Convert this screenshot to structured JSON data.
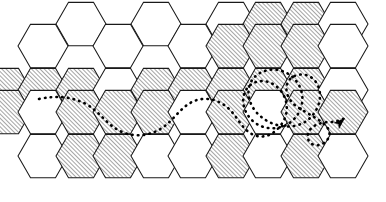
{
  "figure": {
    "title": "Hexagonal cell grid with dotted trajectory",
    "caption": "",
    "width": 386,
    "height": 202,
    "background_color": "#ffffff"
  },
  "style": {
    "outline_color": "#1a1a1a",
    "outline_width": 1.05,
    "hatch_color": "#2b2b2b",
    "hatch_angle_deg": 45,
    "hatch_spacing": 3,
    "fill_white": "#ffffff",
    "path_color": "#000000",
    "path_dot_size": 2.6,
    "path_dot_gap": 5.2
  },
  "grid": {
    "orientation": "flat-top",
    "hex_radius": 25,
    "column_step": 37.5,
    "row_step": 43.3,
    "rows": 4,
    "legend": {
      "hatched_label": "hatched cell",
      "white_label": "empty cell"
    },
    "cells": [
      {
        "id": "r0c2",
        "cx": 81,
        "cy": 24,
        "fill": "hatched_or_white"
      },
      {
        "id": "r0c4",
        "cx": 156,
        "cy": 24,
        "fill": "white"
      },
      {
        "id": "r0c6",
        "cx": 231,
        "cy": 24,
        "fill": "white"
      },
      {
        "id": "r0c7",
        "cx": 268,
        "cy": 24,
        "fill": "hatched"
      },
      {
        "id": "r0c8",
        "cx": 306,
        "cy": 24,
        "fill": "hatched"
      },
      {
        "id": "r0c9",
        "cx": 343,
        "cy": 24,
        "fill": "white"
      },
      {
        "id": "r1c1",
        "cx": 43,
        "cy": 46,
        "fill": "white"
      },
      {
        "id": "r1c3",
        "cx": 118,
        "cy": 46,
        "fill": "white"
      },
      {
        "id": "r1c5",
        "cx": 193,
        "cy": 46,
        "fill": "white"
      },
      {
        "id": "r1c6",
        "cx": 231,
        "cy": 46,
        "fill": "hatched"
      },
      {
        "id": "r1c7",
        "cx": 268,
        "cy": 46,
        "fill": "hatched"
      },
      {
        "id": "r1c8",
        "cx": 306,
        "cy": 46,
        "fill": "hatched"
      },
      {
        "id": "r1c9",
        "cx": 343,
        "cy": 46,
        "fill": "white"
      },
      {
        "id": "r2c0",
        "cx": 6,
        "cy": 90,
        "fill": "hatched"
      },
      {
        "id": "r2c1",
        "cx": 43,
        "cy": 90,
        "fill": "hatched"
      },
      {
        "id": "r2c2",
        "cx": 81,
        "cy": 90,
        "fill": "hatched"
      },
      {
        "id": "r2c3",
        "cx": 118,
        "cy": 90,
        "fill": "white"
      },
      {
        "id": "r2c4",
        "cx": 156,
        "cy": 90,
        "fill": "hatched"
      },
      {
        "id": "r2c5",
        "cx": 193,
        "cy": 90,
        "fill": "hatched"
      },
      {
        "id": "r2c6",
        "cx": 231,
        "cy": 90,
        "fill": "hatched"
      },
      {
        "id": "r2c7",
        "cx": 268,
        "cy": 90,
        "fill": "hatched"
      },
      {
        "id": "r2c8",
        "cx": 306,
        "cy": 90,
        "fill": "hatched"
      },
      {
        "id": "r2c9",
        "cx": 343,
        "cy": 90,
        "fill": "white"
      },
      {
        "id": "r3c0",
        "cx": 6,
        "cy": 112,
        "fill": "hatched"
      },
      {
        "id": "r3c1",
        "cx": 43,
        "cy": 112,
        "fill": "white"
      },
      {
        "id": "r3c2",
        "cx": 81,
        "cy": 112,
        "fill": "hatched"
      },
      {
        "id": "r3c3",
        "cx": 118,
        "cy": 112,
        "fill": "hatched"
      },
      {
        "id": "r3c4",
        "cx": 156,
        "cy": 112,
        "fill": "hatched"
      },
      {
        "id": "r3c5",
        "cx": 193,
        "cy": 112,
        "fill": "white"
      },
      {
        "id": "r3c6",
        "cx": 231,
        "cy": 112,
        "fill": "hatched"
      },
      {
        "id": "r3c7",
        "cx": 268,
        "cy": 112,
        "fill": "white"
      },
      {
        "id": "r3c8",
        "cx": 306,
        "cy": 112,
        "fill": "hatched"
      },
      {
        "id": "r3c9",
        "cx": 343,
        "cy": 112,
        "fill": "hatched"
      },
      {
        "id": "r4c1",
        "cx": 43,
        "cy": 156,
        "fill": "white"
      },
      {
        "id": "r4c2",
        "cx": 81,
        "cy": 156,
        "fill": "hatched"
      },
      {
        "id": "r4c3",
        "cx": 118,
        "cy": 156,
        "fill": "hatched"
      },
      {
        "id": "r4c4",
        "cx": 156,
        "cy": 156,
        "fill": "white"
      },
      {
        "id": "r4c5",
        "cx": 193,
        "cy": 156,
        "fill": "white"
      },
      {
        "id": "r4c6",
        "cx": 231,
        "cy": 156,
        "fill": "hatched"
      },
      {
        "id": "r4c7",
        "cx": 268,
        "cy": 156,
        "fill": "white"
      },
      {
        "id": "r4c8",
        "cx": 306,
        "cy": 156,
        "fill": "hatched"
      },
      {
        "id": "r4c9",
        "cx": 343,
        "cy": 156,
        "fill": "white"
      }
    ]
  },
  "trajectory": {
    "name": "dotted-path",
    "style": "dotted",
    "has_arrowhead": true,
    "arrowhead_position": {
      "x": 345,
      "y": 118
    },
    "arrowhead_angle_deg": -42,
    "start_point": {
      "x": 39,
      "y": 99
    },
    "end_point": {
      "x": 345,
      "y": 118
    },
    "path_d": "M 39 99 C 58 95, 72 97, 86 104 C 100 112, 106 124, 120 131 C 134 138, 150 136, 162 128 C 174 120, 180 108, 192 102 C 204 96, 218 99, 228 108 C 238 117, 242 130, 254 135 C 266 140, 278 132, 284 120 C 290 108, 286 94, 276 86 C 266 78, 252 80, 246 90 C 240 100, 244 114, 254 122 C 264 130, 278 130, 288 124 C 298 118, 304 106, 302 94 C 300 82, 290 72, 278 70 C 266 68, 254 74, 250 84 C 246 94, 250 106, 258 114 C 268 124, 282 128, 294 126 C 306 124, 314 116, 318 106 C 322 96, 320 84, 312 78 C 304 72, 292 74, 288 82 C 284 90, 288 100, 296 106 C 306 113, 318 118, 326 126 C 332 132, 330 140, 322 144 C 314 148, 306 142, 308 134 C 310 126, 320 122, 330 122 C 336 122, 341 120, 345 118",
    "loops": [
      {
        "name": "upper-right-loop",
        "center": {
          "x": 272,
          "y": 96
        },
        "radius": 26
      },
      {
        "name": "right-small-loop",
        "center": {
          "x": 318,
          "y": 132
        },
        "radius": 13
      }
    ]
  }
}
